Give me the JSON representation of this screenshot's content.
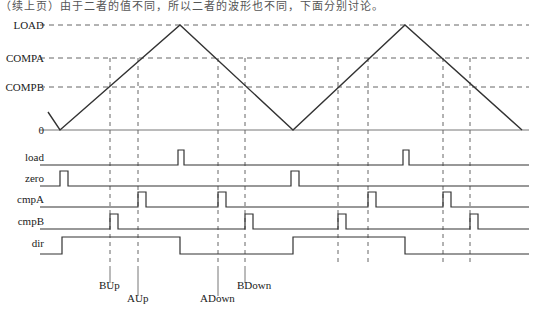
{
  "figure": {
    "type": "timing-diagram",
    "top_note": "（续上页）由于二者的值不同，所以二者的波形也不同，下面分别讨论。",
    "width": 535,
    "height": 311
  },
  "axis_labels": [
    {
      "name": "load-level",
      "text": "LOAD",
      "y": 25
    },
    {
      "name": "compa-level",
      "text": "COMPA",
      "y": 58
    },
    {
      "name": "compb-level",
      "text": "COMPB",
      "y": 87
    },
    {
      "name": "zero-level",
      "text": "0",
      "y": 130
    }
  ],
  "signal_labels": [
    {
      "name": "load",
      "text": "load",
      "y": 157
    },
    {
      "name": "zero",
      "text": "zero",
      "y": 178
    },
    {
      "name": "cmpa",
      "text": "cmpA",
      "y": 199
    },
    {
      "name": "cmpb",
      "text": "cmpB",
      "y": 221
    },
    {
      "name": "dir",
      "text": "dir",
      "y": 243
    }
  ],
  "annotations": [
    {
      "name": "bup",
      "text": "BUp",
      "x": 110,
      "label_x": 99,
      "label_y": 289,
      "tick_top": 266,
      "tick_bottom": 283
    },
    {
      "name": "aup",
      "text": "AUp",
      "x": 138,
      "label_x": 127,
      "label_y": 302,
      "tick_top": 266,
      "tick_bottom": 296
    },
    {
      "name": "adown",
      "text": "ADown",
      "x": 218,
      "label_x": 200,
      "label_y": 302,
      "tick_top": 266,
      "tick_bottom": 296
    },
    {
      "name": "bdown",
      "text": "BDown",
      "x": 245,
      "label_x": 237,
      "label_y": 289,
      "tick_top": 266,
      "tick_bottom": 283
    }
  ],
  "chart_data": {
    "type": "line",
    "title": "",
    "xlabel": "",
    "ylabel": "",
    "levels": {
      "LOAD": 25,
      "COMPA": 58,
      "COMPB": 87,
      "ZERO": 130
    },
    "x_range": [
      48,
      522
    ],
    "carrier": {
      "name": "counter-triangle",
      "points": [
        [
          48,
          112
        ],
        [
          60,
          130
        ],
        [
          180,
          25
        ],
        [
          293,
          130
        ],
        [
          405,
          25
        ],
        [
          522,
          130
        ]
      ]
    },
    "guide_lines_x": [
      110,
      138,
      218,
      245,
      338,
      368,
      443,
      470
    ],
    "series": [
      {
        "name": "load",
        "baseline_y": 165,
        "high_y": 150,
        "pulses": [
          [
            178,
            184
          ],
          [
            403,
            409
          ]
        ]
      },
      {
        "name": "zero",
        "baseline_y": 186,
        "high_y": 171,
        "pulses": [
          [
            60,
            68
          ],
          [
            291,
            299
          ]
        ]
      },
      {
        "name": "cmpA",
        "baseline_y": 207,
        "high_y": 192,
        "pulses": [
          [
            138,
            146
          ],
          [
            218,
            226
          ],
          [
            368,
            376
          ],
          [
            443,
            451
          ]
        ]
      },
      {
        "name": "cmpB",
        "baseline_y": 229,
        "high_y": 214,
        "pulses": [
          [
            110,
            118
          ],
          [
            245,
            253
          ],
          [
            338,
            346
          ],
          [
            470,
            478
          ]
        ]
      },
      {
        "name": "dir",
        "baseline_y": 254,
        "high_y": 237,
        "levels": [
          [
            48,
            62,
            "low"
          ],
          [
            62,
            180,
            "high"
          ],
          [
            180,
            293,
            "low"
          ],
          [
            293,
            405,
            "high"
          ],
          [
            405,
            522,
            "low"
          ]
        ]
      }
    ]
  },
  "colors": {
    "stroke": "#333333",
    "axis": "#777777",
    "dashed": "#666666",
    "background": "#ffffff"
  }
}
